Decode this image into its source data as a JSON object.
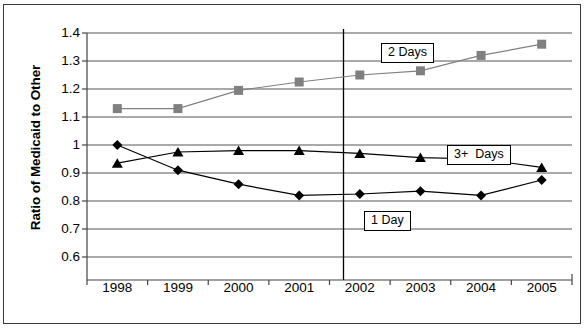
{
  "chart_data": {
    "type": "line",
    "title": "",
    "xlabel": "",
    "ylabel": "Ratio of Medicaid to Other",
    "categories": [
      "1998",
      "1999",
      "2000",
      "2001",
      "2002",
      "2003",
      "2004",
      "2005"
    ],
    "ylim": [
      0.6,
      1.4
    ],
    "ytick_labels": [
      "1.4",
      "1.3",
      "1.2",
      "1.1",
      "1",
      "0.9",
      "0.8",
      "0.7",
      "0.6"
    ],
    "ytick_values": [
      1.4,
      1.3,
      1.2,
      1.1,
      1.0,
      0.9,
      0.8,
      0.7,
      0.6
    ],
    "grid": true,
    "legend_position": "inline-annotations",
    "series": [
      {
        "name": "2 Days",
        "marker": "square",
        "color": "#808080",
        "values": [
          1.13,
          1.13,
          1.195,
          1.225,
          1.25,
          1.265,
          1.32,
          1.36
        ]
      },
      {
        "name": "3+ Days",
        "marker": "triangle",
        "color": "#000000",
        "values": [
          0.935,
          0.975,
          0.98,
          0.98,
          0.97,
          0.955,
          0.95,
          0.92
        ]
      },
      {
        "name": "1 Day",
        "marker": "diamond",
        "color": "#000000",
        "values": [
          1.0,
          0.91,
          0.86,
          0.82,
          0.825,
          0.835,
          0.82,
          0.875
        ]
      }
    ],
    "annotations": [
      {
        "text": "2 Days",
        "x": 381,
        "y": 43
      },
      {
        "text": "3+  Days",
        "x": 447,
        "y": 145
      },
      {
        "text": "1 Day",
        "x": 364,
        "y": 211
      },
      {
        "text": "vertical-divider",
        "x": 343.5,
        "y_top": 29,
        "y_bottom": 280
      }
    ]
  }
}
